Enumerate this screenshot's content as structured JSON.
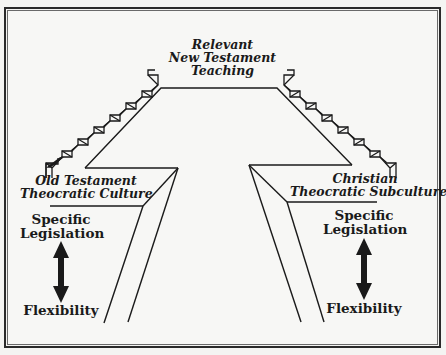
{
  "diagram": {
    "top_label": [
      "Relevant",
      "New Testament",
      "Teaching"
    ],
    "left_culture": [
      "Old Testament",
      "Theocratic Culture"
    ],
    "right_culture": [
      "Christian",
      "Theocratic Subculture"
    ],
    "left_scale": {
      "top": [
        "Specific",
        "Legislation"
      ],
      "bottom": "Flexibility",
      "arrow": "double-headed-vertical-arrow"
    },
    "right_scale": {
      "top": [
        "Specific",
        "Legislation"
      ],
      "bottom": "Flexibility",
      "arrow": "double-headed-vertical-arrow"
    },
    "icons": {
      "left_stairs": "staircase-ascending-right",
      "right_stairs": "staircase-ascending-left"
    },
    "colors": {
      "ink": "#1a1a1a",
      "paper": "#f7f7f5"
    }
  }
}
